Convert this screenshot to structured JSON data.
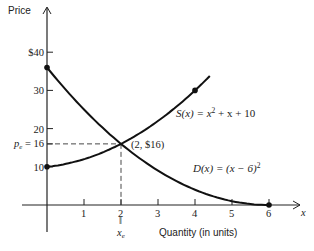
{
  "chart_data": {
    "type": "line",
    "title": "",
    "xlabel": "Quantity (in units)",
    "ylabel": "Price",
    "x_axis_symbol": "x",
    "xlim": [
      0,
      6.3
    ],
    "ylim": [
      0,
      42
    ],
    "x_ticks": [
      1,
      2,
      3,
      4,
      5,
      6
    ],
    "x_tick_labels": [
      "1",
      "2",
      "3",
      "4",
      "5",
      "6"
    ],
    "y_ticks": [
      10,
      16,
      20,
      30,
      40
    ],
    "y_tick_labels": [
      "10",
      "16",
      "20",
      "30",
      "$40"
    ],
    "grid": false,
    "series": [
      {
        "name": "S(x) = x² + x + 10",
        "role": "supply",
        "formula": "x^2 + x + 10",
        "x": [
          0,
          0.5,
          1,
          1.5,
          2,
          2.5,
          3,
          3.5,
          4,
          4.4
        ],
        "values": [
          10,
          10.75,
          12,
          13.75,
          16,
          18.75,
          22,
          25.25,
          30,
          33.76
        ],
        "marked_points": [
          [
            0,
            10
          ],
          [
            4,
            30
          ]
        ]
      },
      {
        "name": "D(x) = (x−6)²",
        "role": "demand",
        "formula": "(x-6)^2",
        "x": [
          0,
          0.5,
          1,
          1.5,
          2,
          2.5,
          3,
          3.5,
          4,
          4.5,
          5,
          5.5,
          6
        ],
        "values": [
          36,
          30.25,
          25,
          20.25,
          16,
          12.25,
          9,
          6.25,
          4,
          2.25,
          1,
          0.25,
          0
        ],
        "marked_points": [
          [
            0,
            36
          ],
          [
            6,
            0
          ]
        ]
      }
    ],
    "equilibrium": {
      "x": 2,
      "y": 16,
      "label": "(2, $16)"
    },
    "annotations": [
      {
        "text": "S(x) = x² + x + 10",
        "near": [
          4.3,
          25
        ]
      },
      {
        "text": "D(x) = (x−6)²",
        "near": [
          4.4,
          6
        ]
      },
      {
        "text": "(2, $16)",
        "near": [
          2.1,
          16
        ]
      },
      {
        "text": "p_e = 16",
        "position": "y-axis at 16"
      },
      {
        "text": "x_e",
        "position": "below x tick 2, with '||' equals sign"
      }
    ],
    "legend": "none (inline labels)"
  },
  "labels": {
    "y_axis_title": "Price",
    "x_axis_title": "Quantity (in units)",
    "x_axis_symbol": "x",
    "pe_prefix": "p",
    "pe_sub": "e",
    "pe_suffix": " = 16",
    "xe_main": "x",
    "xe_sub": "e",
    "xe_eq": "‖",
    "eq_point": "(2, $16)",
    "supply_eq": "S(x) = x",
    "supply_sup": "2",
    "supply_tail": " + x + 10",
    "demand_eq": "D(x) = (x − 6)",
    "demand_sup": "2"
  }
}
